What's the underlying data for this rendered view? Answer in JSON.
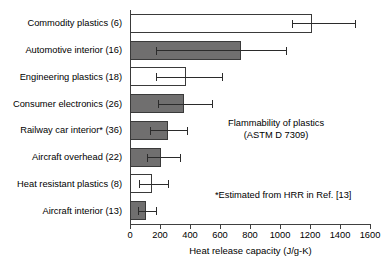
{
  "chart_data": {
    "type": "bar",
    "orientation": "horizontal",
    "title": "",
    "xlabel": "Heat release capacity (J/g-K)",
    "ylabel": "",
    "xlim": [
      0,
      1600
    ],
    "xticks": [
      0,
      200,
      400,
      600,
      800,
      1000,
      1200,
      1400,
      1600
    ],
    "grid": false,
    "legend": false,
    "categories": [
      "Commodity plastics (6)",
      "Automotive interior (16)",
      "Engineering plastics (18)",
      "Consumer electronics (26)",
      "Railway car interior* (36)",
      "Aircraft overhead (22)",
      "Heat resistant plastics (8)",
      "Aircraft interior (13)"
    ],
    "values": [
      1215,
      740,
      375,
      360,
      255,
      205,
      145,
      105
    ],
    "error_low": [
      1080,
      170,
      170,
      185,
      130,
      115,
      60,
      50
    ],
    "error_high": [
      1500,
      1040,
      615,
      545,
      380,
      335,
      250,
      170
    ],
    "bar_styles": [
      "open",
      "filled",
      "open",
      "filled",
      "filled",
      "filled",
      "open",
      "filled"
    ],
    "annotations": [
      "Flammability of plastics",
      "(ASTM D 7309)",
      "*Estimated from HRR in Ref. [13]"
    ],
    "colors": {
      "filled": "#706f6f",
      "open": "#ffffff",
      "outline": "#3a3a3a",
      "error": "#2b2b2b",
      "axis": "#404040",
      "text": "#000000"
    }
  },
  "annotation_main_line1": "Flammability of plastics",
  "annotation_main_line2": "(ASTM D 7309)",
  "annotation_footnote": "*Estimated from HRR in Ref. [13]"
}
